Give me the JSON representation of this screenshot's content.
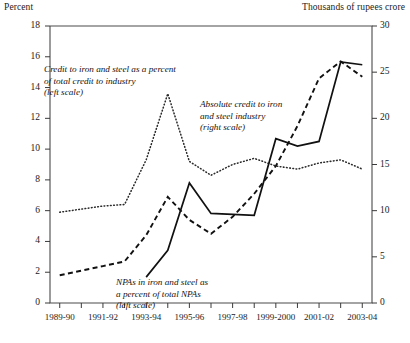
{
  "chart_data": {
    "type": "line",
    "title": "",
    "left_axis_title": "Percent",
    "right_axis_title": "Thousands of rupees crore",
    "xlabel": "",
    "ylabel": "Percent",
    "y2label": "Thousands of rupees crore",
    "ylim": [
      0,
      18
    ],
    "y2lim": [
      0,
      30
    ],
    "left_ticks": [
      0,
      2,
      4,
      6,
      8,
      10,
      12,
      14,
      16,
      18
    ],
    "right_ticks": [
      0,
      5,
      10,
      15,
      20,
      25,
      30
    ],
    "grid": false,
    "legend": "annotations-inline",
    "x": [
      "1989-90",
      "1990-91",
      "1991-92",
      "1992-93",
      "1993-94",
      "1994-95",
      "1995-96",
      "1996-97",
      "1997-98",
      "1998-99",
      "1999-2000",
      "2000-01",
      "2001-02",
      "2002-03",
      "2003-04"
    ],
    "xtick_labels_shown": [
      "1989-90",
      "1991-92",
      "1993-94",
      "1995-96",
      "1997-98",
      "1999-2000",
      "2001-02",
      "2003-04"
    ],
    "series": [
      {
        "name": "Credit to iron and steel as a percent of total credit to industry",
        "scale": "left",
        "style": "dotted",
        "axis_units": "percent",
        "values": [
          5.9,
          6.1,
          6.3,
          6.4,
          9.3,
          13.6,
          9.2,
          8.3,
          9.0,
          9.4,
          8.9,
          8.7,
          9.1,
          9.3,
          8.7
        ]
      },
      {
        "name": "NPAs in iron and steel as a percent of total NPAs",
        "scale": "left",
        "style": "dashed",
        "axis_units": "percent",
        "values": [
          1.8,
          2.1,
          2.4,
          2.7,
          4.4,
          6.9,
          5.4,
          4.5,
          5.6,
          7.1,
          8.9,
          11.5,
          14.6,
          15.7,
          14.7
        ]
      },
      {
        "name": "Absolute credit to iron and steel industry",
        "scale": "right",
        "style": "solid",
        "axis_units": "thousands of rupees crore",
        "values": [
          null,
          null,
          null,
          null,
          2.8,
          5.7,
          13.0,
          9.7,
          9.6,
          9.5,
          17.8,
          17.0,
          17.5,
          26.1,
          25.8
        ]
      }
    ],
    "annotations": [
      {
        "id": "credit-percent",
        "lines": [
          "Credit to iron and steel as a percent",
          "of total credit to industry",
          "(left scale)"
        ]
      },
      {
        "id": "absolute-credit",
        "lines": [
          "Absolute credit to iron",
          "and steel industry",
          "(right scale)"
        ]
      },
      {
        "id": "npa-percent",
        "lines": [
          "NPAs in iron and steel as",
          "a percent of total NPAs",
          "(left scale)"
        ]
      }
    ]
  },
  "axes": {
    "left_title": "Percent",
    "right_title": "Thousands of rupees crore",
    "left_tick_labels": [
      "18",
      "16",
      "14",
      "12",
      "10",
      "8",
      "6",
      "4",
      "2",
      "0"
    ],
    "right_tick_labels": [
      "30",
      "25",
      "20",
      "15",
      "10",
      "5",
      "0"
    ],
    "x_tick_labels": [
      "1989-90",
      "1991-92",
      "1993-94",
      "1995-96",
      "1997-98",
      "1999-2000",
      "2001-02",
      "2003-04"
    ]
  },
  "annotations": {
    "credit": {
      "line1": "Credit to iron and steel as a percent",
      "line2": "of total credit to industry",
      "line3": "(left scale)"
    },
    "absolute": {
      "line1": "Absolute credit to iron",
      "line2": "and steel industry",
      "line3": "(right scale)"
    },
    "npa": {
      "line1": "NPAs in iron and steel as",
      "line2": "a percent of total NPAs",
      "line3": "(left scale)"
    }
  }
}
